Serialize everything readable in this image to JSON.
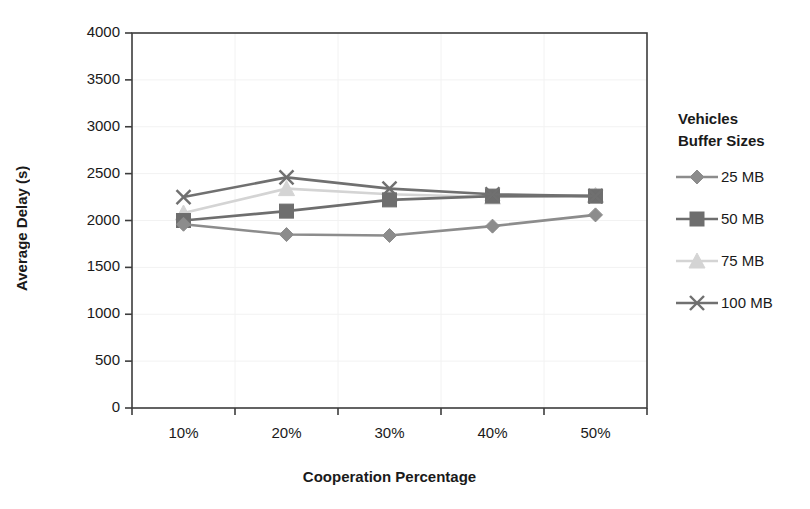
{
  "chart_data": {
    "type": "line",
    "title": "",
    "xlabel": "Cooperation Percentage",
    "ylabel": "Average Delay (s)",
    "categories": [
      "10%",
      "20%",
      "30%",
      "40%",
      "50%"
    ],
    "ylim": [
      0,
      4000
    ],
    "yticks": [
      0,
      500,
      1000,
      1500,
      2000,
      2500,
      3000,
      3500,
      4000
    ],
    "ytick_labels": [
      "0",
      "500",
      "1000",
      "1500",
      "2000",
      "2500",
      "3000",
      "3500",
      "4000"
    ],
    "grid": true,
    "grid_color": "#f2f2f2",
    "legend_position": "right",
    "legend_title": "Vehicles\nBuffer Sizes",
    "series": [
      {
        "name": "25 MB",
        "marker": "diamond",
        "color": "#8c8c8c",
        "values": [
          1960,
          1850,
          1840,
          1940,
          2060
        ]
      },
      {
        "name": "50 MB",
        "marker": "square",
        "color": "#6e6e6e",
        "values": [
          2000,
          2100,
          2220,
          2260,
          2260
        ]
      },
      {
        "name": "75 MB",
        "marker": "triangle",
        "color": "#d4d4d4",
        "values": [
          2080,
          2340,
          2280,
          2250,
          2270
        ]
      },
      {
        "name": "100 MB",
        "marker": "x",
        "color": "#707070",
        "values": [
          2250,
          2460,
          2340,
          2280,
          2260
        ]
      }
    ]
  },
  "axes": {
    "frame_color": "#3d3d3d",
    "tick_color": "#3d3d3d"
  },
  "legend": {
    "title_line1": "Vehicles",
    "title_line2": "Buffer Sizes",
    "entries": [
      {
        "label": "25 MB"
      },
      {
        "label": "50 MB"
      },
      {
        "label": "75 MB"
      },
      {
        "label": "100 MB"
      }
    ]
  }
}
